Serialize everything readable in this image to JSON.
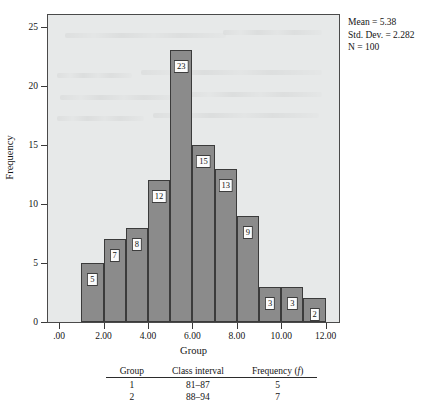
{
  "chart_data": {
    "type": "bar",
    "title": "",
    "subtitle": "",
    "xlabel": "Group",
    "ylabel": "Frequency",
    "x": [
      1,
      2,
      3,
      4,
      5,
      6,
      7,
      8,
      9,
      10,
      11
    ],
    "bar_left_edges": [
      1,
      2,
      3,
      4,
      5,
      6,
      7,
      8,
      9,
      10,
      11
    ],
    "bar_width": 1,
    "values": [
      5,
      7,
      8,
      12,
      23,
      15,
      13,
      9,
      3,
      3,
      2
    ],
    "bar_labels": [
      "5",
      "7",
      "8",
      "12",
      "23",
      "15",
      "13",
      "9",
      "3",
      "3",
      "2"
    ],
    "xlim": [
      -0.5,
      12.6
    ],
    "ylim": [
      0,
      26
    ],
    "xticks": [
      0,
      2,
      4,
      6,
      8,
      10,
      12
    ],
    "xticklabels": [
      ".00",
      "2.00",
      "4.00",
      "6.00",
      "8.00",
      "10.00",
      "12.00"
    ],
    "yticks": [
      0,
      5,
      10,
      15,
      20,
      25
    ],
    "yticklabels": [
      "0",
      "5",
      "10",
      "15",
      "20",
      "25"
    ],
    "grid": false,
    "legend": null,
    "bar_color": "#8b8b8b",
    "bar_edge_color": "#3b3b3b",
    "plot_background": "#e7e9e9",
    "annotations": [
      "Mean = 5.38",
      "Std. Dev. = 2.282",
      "N = 100"
    ]
  },
  "stats": {
    "mean": "Mean = 5.38",
    "std_dev": "Std. Dev. = 2.282",
    "n": "N = 100"
  },
  "axes": {
    "x_title": "Group",
    "y_title": "Frequency"
  },
  "table": {
    "headers": [
      "Group",
      "Class interval",
      "Frequency ("
    ],
    "header_group": "Group",
    "header_class_interval": "Class interval",
    "header_frequency_prefix": "Frequency (",
    "header_frequency_italic": "f",
    "header_frequency_suffix": ")",
    "rows": [
      {
        "group": "1",
        "class_interval": "81–87",
        "frequency": "5"
      },
      {
        "group": "2",
        "class_interval": "88–94",
        "frequency": "7"
      }
    ]
  }
}
